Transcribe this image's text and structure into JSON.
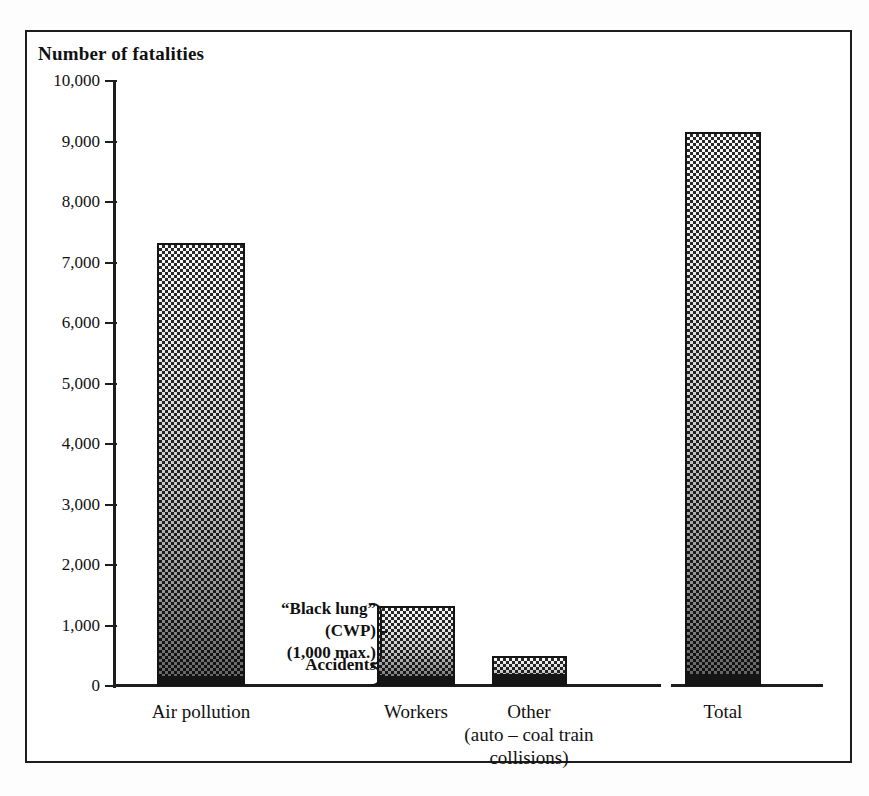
{
  "chart_data": {
    "type": "bar",
    "title": "Number of fatalities",
    "subtitle": "",
    "xlabel": "",
    "ylabel": "Number of fatalities",
    "ylim": [
      0,
      10000
    ],
    "grid": false,
    "legend_position": "none",
    "categories": [
      "Air pollution",
      "Workers",
      "Other\n(auto – coal train\ncollisions)",
      "Total"
    ],
    "category_labels": [
      {
        "line1": "Air pollution",
        "line2": "",
        "line3": ""
      },
      {
        "line1": "Workers",
        "line2": "",
        "line3": ""
      },
      {
        "line1": "Other",
        "line2": "(auto – coal train",
        "line3": "collisions)"
      },
      {
        "line1": "Total",
        "line2": "",
        "line3": ""
      }
    ],
    "values": [
      7320,
      1320,
      500,
      9150
    ],
    "series": [
      {
        "name": "Chronic / disease fatalities",
        "values": [
          7150,
          1150,
          300,
          8950
        ]
      },
      {
        "name": "Accidents",
        "values": [
          170,
          170,
          200,
          200
        ]
      }
    ],
    "tick_labels": [
      "10,000",
      "9,000",
      "8,000",
      "7,000",
      "6,000",
      "5,000",
      "4,000",
      "3,000",
      "2,000",
      "1,000",
      "0"
    ],
    "tick_values": [
      10000,
      9000,
      8000,
      7000,
      6000,
      5000,
      4000,
      3000,
      2000,
      1000,
      0
    ],
    "annotations": [
      {
        "id": "cwp",
        "line1": "“Black lung”",
        "line2": "(CWP)",
        "line3": "(1,000 max.)"
      },
      {
        "id": "accidents",
        "text": "Accidents"
      }
    ],
    "colors": {
      "bar_fill_light": "#efefef",
      "bar_fill_dark": "#2a2a2a",
      "bar_border": "#141414",
      "accident_segment": "#151515",
      "axis": "#1d1d1d",
      "frame": "#1d1d1d",
      "background": "#ffffff"
    }
  },
  "annotation": {
    "cwp_line1": "“Black lung”",
    "cwp_line2": "(CWP)",
    "cwp_line3": "(1,000 max.)",
    "accidents": "Accidents"
  },
  "axis": {
    "title": "Number of fatalities",
    "ticks": [
      {
        "label": "10,000",
        "value": 10000
      },
      {
        "label": "9,000",
        "value": 9000
      },
      {
        "label": "8,000",
        "value": 8000
      },
      {
        "label": "7,000",
        "value": 7000
      },
      {
        "label": "6,000",
        "value": 6000
      },
      {
        "label": "5,000",
        "value": 5000
      },
      {
        "label": "4,000",
        "value": 4000
      },
      {
        "label": "3,000",
        "value": 3000
      },
      {
        "label": "2,000",
        "value": 2000
      },
      {
        "label": "1,000",
        "value": 1000
      },
      {
        "label": "0",
        "value": 0
      }
    ]
  },
  "bars": [
    {
      "name": "air-pollution",
      "label_line1": "Air pollution",
      "label_line2": "",
      "label_line3": "",
      "value": 7320,
      "accidents": 170,
      "center_x": 201,
      "width": 88
    },
    {
      "name": "workers",
      "label_line1": "Workers",
      "label_line2": "",
      "label_line3": "",
      "value": 1320,
      "accidents": 170,
      "center_x": 416,
      "width": 78
    },
    {
      "name": "other",
      "label_line1": "Other",
      "label_line2": "(auto – coal train",
      "label_line3": "collisions)",
      "value": 500,
      "accidents": 200,
      "center_x": 529,
      "width": 75
    },
    {
      "name": "total",
      "label_line1": "Total",
      "label_line2": "",
      "label_line3": "",
      "value": 9150,
      "accidents": 200,
      "center_x": 723,
      "width": 76
    }
  ]
}
